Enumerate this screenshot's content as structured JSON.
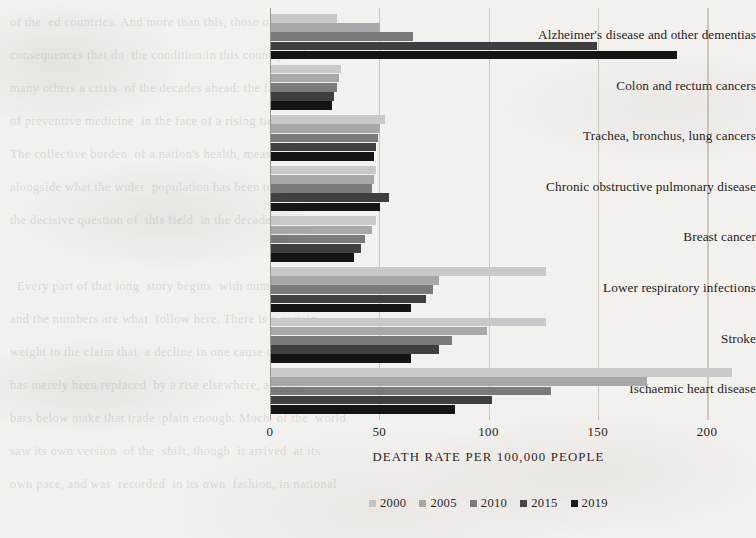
{
  "chart_data": {
    "type": "bar",
    "orientation": "horizontal",
    "title": "",
    "xlabel": "DEATH RATE PER 100,000 PEOPLE",
    "ylabel": "",
    "xlim": [
      0,
      215
    ],
    "xticks": [
      0,
      50,
      100,
      150,
      200
    ],
    "xtick_labels": [
      "0",
      "50",
      "100",
      "150",
      "200"
    ],
    "grid": "vertical-faint",
    "legend_position": "bottom-center",
    "categories": [
      "Alzheimer's disease and other dementias",
      "Colon and rectum cancers",
      "Trachea, bronchus, lung cancers",
      "Chronic obstructive pulmonary disease",
      "Breast cancer",
      "Lower respiratory infections",
      "Stroke",
      "Ischaemic heart disease"
    ],
    "series": [
      {
        "name": "2000",
        "color": "#c9c9c9",
        "values": [
          30,
          32,
          52,
          48,
          48,
          126,
          126,
          211
        ]
      },
      {
        "name": "2005",
        "color": "#a8a8a8",
        "values": [
          50,
          31,
          50,
          47,
          46,
          77,
          99,
          172
        ]
      },
      {
        "name": "2010",
        "color": "#7a7a7a",
        "values": [
          65,
          30,
          49,
          46,
          43,
          74,
          83,
          128
        ]
      },
      {
        "name": "2015",
        "color": "#3f3f3f",
        "values": [
          149,
          29,
          48,
          54,
          41,
          71,
          77,
          101
        ]
      },
      {
        "name": "2019",
        "color": "#141414",
        "values": [
          186,
          28,
          47,
          50,
          38,
          64,
          64,
          84
        ]
      }
    ]
  },
  "legend": {
    "entries": [
      {
        "label": "2000",
        "color": "#c9c9c9"
      },
      {
        "label": "2005",
        "color": "#a8a8a8"
      },
      {
        "label": "2010",
        "color": "#7a7a7a"
      },
      {
        "label": "2015",
        "color": "#3f3f3f"
      },
      {
        "label": "2019",
        "color": "#141414"
      }
    ]
  },
  "page_background_text": "of the  ed countries. And more than this, those of its in\nconsequences that do  the condition in this country and\nmany others a crisis  of the decades ahead: the failure\nof preventive medicine  in the face of a rising tide.\nThe collective burden  of a nation's health, measured\nalongside what the wider  population has been told, remains\nthe decisive question of  this field  in the decades.\n\n  Every part of that long  story begins  with numbers,\nand the numbers are what  follow here. There is a certain\nweight to the claim that  a decline in one cause of death\nhas merely been replaced  by a rise elsewhere, and the\nbars below make that trade  plain enough. Much  of the  world\nsaw its own version  of the  shift, though  it arrived  at its\nown pace, and was  recorded  in its own  fashion, in national"
}
